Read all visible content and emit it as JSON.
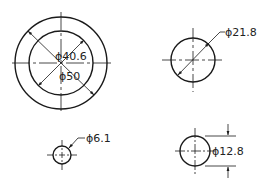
{
  "drawing": {
    "features": [
      {
        "id": "large-bore",
        "outer_dim": "ϕ50",
        "inner_dim": "ϕ40.6"
      },
      {
        "id": "medium-hole",
        "dim": "ϕ21.8"
      },
      {
        "id": "small-hole",
        "dim": "ϕ6.1"
      },
      {
        "id": "hole-linear",
        "dim": "ϕ12.8"
      }
    ],
    "line_color": "#1a1a1a"
  }
}
